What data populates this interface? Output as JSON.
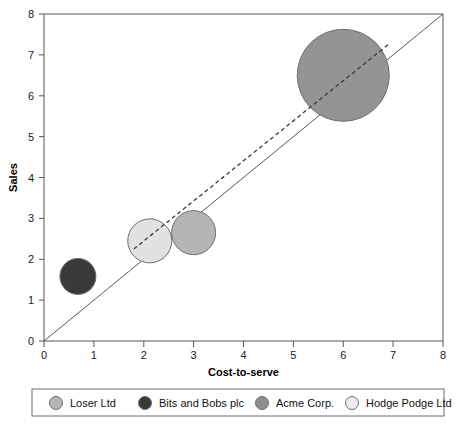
{
  "chart_data": {
    "type": "scatter",
    "title": "",
    "xlabel": "Cost-to-serve",
    "ylabel": "Sales",
    "xlim": [
      0,
      8
    ],
    "ylim": [
      0,
      8
    ],
    "grid": false,
    "legend_position": "bottom",
    "x_ticks": [
      "0",
      "1",
      "2",
      "3",
      "4",
      "5",
      "6",
      "7",
      "8"
    ],
    "y_ticks": [
      "0",
      "1",
      "2",
      "3",
      "4",
      "5",
      "6",
      "7",
      "8"
    ],
    "bubble_size_encoding": "radius",
    "points": [
      {
        "name": "Bits and Bobs plc",
        "x": 0.68,
        "y": 1.58,
        "radius": 18,
        "color": "#3a3a3a"
      },
      {
        "name": "Hodge Podge Ltd",
        "x": 2.12,
        "y": 2.45,
        "radius": 22,
        "color": "#e2e2e2"
      },
      {
        "name": "Loser Ltd",
        "x": 3.0,
        "y": 2.65,
        "radius": 22,
        "color": "#b5b5b5"
      },
      {
        "name": "Acme Corp.",
        "x": 6.0,
        "y": 6.5,
        "radius": 46,
        "color": "#949494"
      }
    ],
    "reference_line": {
      "name": "diagonal",
      "from": [
        0,
        0
      ],
      "to": [
        8,
        8
      ],
      "style": "solid"
    },
    "fit_line": {
      "name": "trend",
      "from": [
        1.8,
        2.25
      ],
      "to": [
        6.9,
        7.25
      ],
      "style": "dashed"
    },
    "legend": [
      {
        "label": "Loser Ltd",
        "color": "#b5b5b5"
      },
      {
        "label": "Bits and Bobs plc",
        "color": "#3a3a3a"
      },
      {
        "label": "Acme Corp.",
        "color": "#8f8f8f"
      },
      {
        "label": "Hodge Podge Ltd",
        "color": "#ececec"
      }
    ]
  }
}
